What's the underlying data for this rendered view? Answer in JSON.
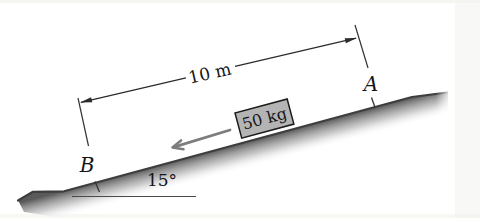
{
  "figure": {
    "type": "inclined-plane-diagram",
    "labels": {
      "distance": "10 m",
      "mass": "50 kg",
      "angle": "15°",
      "point_top": "A",
      "point_bottom": "B"
    },
    "values": {
      "distance_m": 10,
      "mass_kg": 50,
      "incline_angle_deg": 15
    },
    "colors": {
      "line": "#2b2b2b",
      "incline_edge": "#3e3e3e",
      "incline_shade_dark": "#5a5a5a",
      "block_fill": "#b4b4b4",
      "block_border": "#1c1c1c",
      "motion_arrow": "#7d7d7d",
      "background": "#ffffff"
    }
  }
}
